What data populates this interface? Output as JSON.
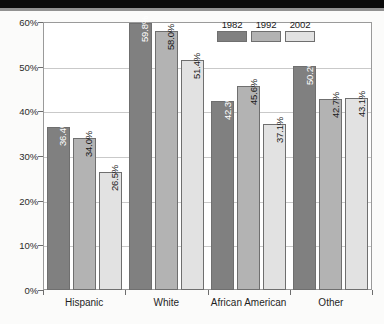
{
  "chart_data": {
    "type": "bar",
    "title": "",
    "subtitle": "",
    "xlabel": "",
    "ylabel": "",
    "categories": [
      "Hispanic",
      "White",
      "African American",
      "Other"
    ],
    "series": [
      {
        "name": "1982",
        "color": "#808080",
        "values": [
          36.4,
          59.8,
          42.3,
          50.2
        ],
        "labels": [
          "36.4%",
          "59.8%",
          "42.3%",
          "50.2%"
        ]
      },
      {
        "name": "1992",
        "color": "#b3b3b3",
        "values": [
          34.0,
          58.0,
          45.6,
          42.7
        ],
        "labels": [
          "34.0%",
          "58.0%",
          "45.6%",
          "42.7%"
        ]
      },
      {
        "name": "2002",
        "color": "#e2e2e2",
        "values": [
          26.5,
          51.4,
          37.1,
          43.1
        ],
        "labels": [
          "26.5%",
          "51.4%",
          "37.1%",
          "43.1%"
        ]
      }
    ],
    "ylim": [
      0,
      60
    ],
    "ytick_values": [
      0,
      10,
      20,
      30,
      40,
      50,
      60
    ],
    "ytick_labels": [
      "0%",
      "10%",
      "20%",
      "30%",
      "40%",
      "50%",
      "60%"
    ],
    "grid": true,
    "grid_axis": "y",
    "legend_position": "top-right",
    "value_label_rotation": 90
  },
  "legend": {
    "entries": [
      {
        "label": "1982",
        "color": "#808080"
      },
      {
        "label": "1992",
        "color": "#b3b3b3"
      },
      {
        "label": "2002",
        "color": "#e2e2e2"
      }
    ]
  },
  "axes": {
    "y_ticks": [
      {
        "label": "60%",
        "value": 60
      },
      {
        "label": "50%",
        "value": 50
      },
      {
        "label": "40%",
        "value": 40
      },
      {
        "label": "30%",
        "value": 30
      },
      {
        "label": "20%",
        "value": 20
      },
      {
        "label": "10%",
        "value": 10
      },
      {
        "label": "0%",
        "value": 0
      }
    ],
    "x_categories": [
      "Hispanic",
      "White",
      "African American",
      "Other"
    ]
  },
  "colors": {
    "series_1982": "#808080",
    "series_1992": "#b3b3b3",
    "series_2002": "#e2e2e2",
    "bar_border": "#6f6f6f",
    "gridline": "#c9c9c9",
    "frame": "#9a9a9a",
    "text": "#1f1f1f",
    "plot_background": "#ffffff",
    "page_background": "#fbfbfa"
  }
}
